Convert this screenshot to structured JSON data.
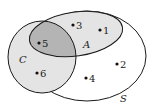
{
  "diagram": {
    "type": "venn",
    "universal_set": {
      "label": "S"
    },
    "sets": [
      {
        "label": "A",
        "fill": "#e4e4e4"
      },
      {
        "label": "C",
        "fill": "#e4e4e4"
      }
    ],
    "intersection_fill": "#b4b4b4",
    "elements": [
      {
        "label": "1",
        "region": "A only"
      },
      {
        "label": "2",
        "region": "S only"
      },
      {
        "label": "3",
        "region": "A only"
      },
      {
        "label": "4",
        "region": "S only"
      },
      {
        "label": "5",
        "region": "A and C"
      },
      {
        "label": "6",
        "region": "C only"
      }
    ]
  }
}
